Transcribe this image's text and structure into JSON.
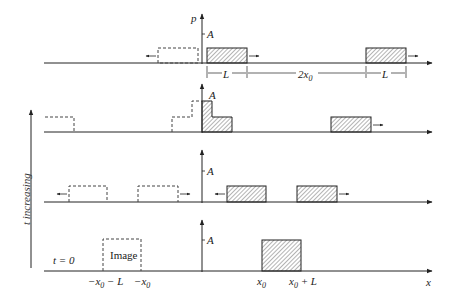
{
  "diagram": {
    "vertical_axis_label": "p",
    "horizontal_axis_label": "x",
    "amplitude_label": "A",
    "time_axis_label": "t increasing",
    "initial_time_label": "t = 0",
    "image_label": "Image",
    "dimension_labels": {
      "width_left": "L",
      "separation": "2x",
      "separation_sub": "0",
      "width_right": "L"
    },
    "tick_labels": [
      {
        "main": "−x",
        "sub": "0",
        "rest": " − L"
      },
      {
        "main": "−x",
        "sub": "0",
        "rest": ""
      },
      {
        "main": "x",
        "sub": "0",
        "rest": ""
      },
      {
        "main": "x",
        "sub": "0",
        "rest": " + L"
      }
    ],
    "colors": {
      "line": "#222222",
      "hatch": "#444444",
      "dashed": "#444444"
    }
  }
}
